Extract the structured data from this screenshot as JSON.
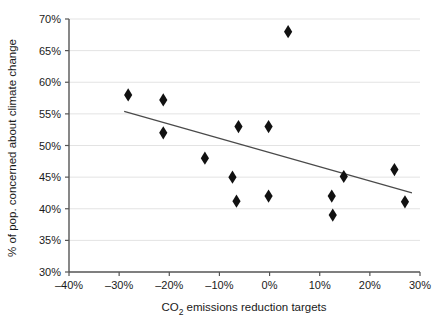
{
  "chart_data": {
    "type": "scatter",
    "title": "",
    "xlabel": "CO2 emissions reduction targets",
    "xlabel_parts": {
      "pre": "CO",
      "sub": "2",
      "post": " emissions reduction targets"
    },
    "ylabel": "% of pop. concerned about climate change",
    "xlim": [
      -40,
      30
    ],
    "ylim": [
      30,
      70
    ],
    "xticks": [
      -40,
      -30,
      -20,
      -10,
      0,
      10,
      20,
      30
    ],
    "yticks": [
      30,
      35,
      40,
      45,
      50,
      55,
      60,
      65,
      70
    ],
    "xticklabels": [
      "–40%",
      "–30%",
      "–20%",
      "–10%",
      "0%",
      "10%",
      "20%",
      "30%"
    ],
    "yticklabels": [
      "30%",
      "35%",
      "40%",
      "45%",
      "50%",
      "55%",
      "60%",
      "65%",
      "70%"
    ],
    "grid": "horizontal",
    "grid_color": "#e3e3e3",
    "legend": "none",
    "marker": "diamond",
    "marker_color": "#111111",
    "points": [
      {
        "x": -28.2,
        "y": 58.0
      },
      {
        "x": -21.2,
        "y": 57.2
      },
      {
        "x": -21.2,
        "y": 52.0
      },
      {
        "x": -12.9,
        "y": 48.0
      },
      {
        "x": -7.4,
        "y": 45.0
      },
      {
        "x": -6.6,
        "y": 41.2
      },
      {
        "x": -6.2,
        "y": 53.0
      },
      {
        "x": -0.2,
        "y": 53.0
      },
      {
        "x": -0.2,
        "y": 42.0
      },
      {
        "x": 3.7,
        "y": 68.0
      },
      {
        "x": 12.4,
        "y": 42.0
      },
      {
        "x": 12.6,
        "y": 39.0
      },
      {
        "x": 14.8,
        "y": 45.1
      },
      {
        "x": 24.9,
        "y": 46.2
      },
      {
        "x": 27.0,
        "y": 41.1
      }
    ],
    "trendline": {
      "type": "linear",
      "x_start": -29.0,
      "y_start": 55.4,
      "x_end": 28.4,
      "y_end": 42.5,
      "color": "#4a4a4a"
    }
  }
}
